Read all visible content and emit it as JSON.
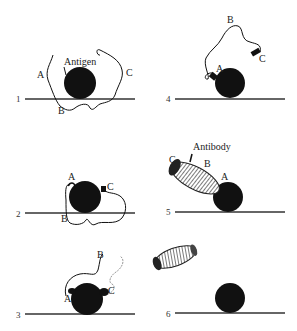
{
  "figure": {
    "colors": {
      "ink": "#111111",
      "surface_line": "#333333",
      "background": "#ffffff"
    },
    "panels": [
      {
        "number": "1",
        "labels": {
          "a": "A",
          "b": "B",
          "c": "C",
          "annotation": "Antigen"
        }
      },
      {
        "number": "2",
        "labels": {
          "a": "A",
          "b": "B",
          "c": "C"
        }
      },
      {
        "number": "3",
        "labels": {
          "a": "A",
          "b": "B",
          "c": "C"
        }
      },
      {
        "number": "4",
        "labels": {
          "a": "A",
          "b": "B",
          "c": "C"
        }
      },
      {
        "number": "5",
        "labels": {
          "a": "A",
          "b": "B",
          "c": "C",
          "annotation": "Antibody"
        }
      },
      {
        "number": "6",
        "labels": {}
      }
    ]
  }
}
